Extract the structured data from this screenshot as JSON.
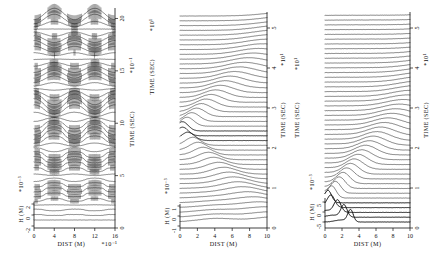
{
  "figure": {
    "title": "",
    "background": "#ffffff",
    "ink": "#111111",
    "panel_count": 3
  },
  "chart_data": [
    {
      "id": "panel-a",
      "type": "line",
      "description": "Stacked wave-height snapshots versus distance at successive times; standing-wave / resonant pattern with dense vertical hatching at the antinodes.",
      "title": "",
      "xlabel": "DIST (M)",
      "x_exponent": "*10⁻¹",
      "ylabel": "H (M)",
      "y_exponent": "*10⁻³",
      "right_axis_label": "TIME (SEC)",
      "right_axis_exponent": "*10⁻¹",
      "xlim": [
        0,
        16
      ],
      "xticks": [
        0,
        4,
        8,
        12,
        16
      ],
      "xticklabels": [
        "0",
        "4",
        "8",
        "12",
        "16"
      ],
      "ylim": [
        -2,
        2
      ],
      "yticks": [
        -2,
        0,
        2
      ],
      "yticklabels": [
        "-2",
        "0",
        "2"
      ],
      "time_lim": [
        0,
        21
      ],
      "time_ticks": [
        0,
        5,
        10,
        15,
        20
      ],
      "time_ticklabels": [
        "0",
        "5",
        "10",
        "15",
        "20"
      ],
      "grid": false,
      "legend": "none",
      "n_traces": 42,
      "trace_style": "solid-black-hairline",
      "hatching": true,
      "pattern": "standing-wave"
    },
    {
      "id": "panel-b",
      "type": "line",
      "description": "Stacked wave-height snapshots versus distance at successive times; single crest focusing at x≈0 then propagating to the right with increasing time.",
      "title": "",
      "xlabel": "DIST (M)",
      "x_exponent": "",
      "ylabel": "H (M)",
      "y_exponent": "*10⁻³",
      "left_axis_label": "TIME (SEC)",
      "left_axis_exponent": "*10¹",
      "right_axis_label": "TIME (SEC)",
      "right_axis_exponent": "*10¹",
      "xlim": [
        0,
        10
      ],
      "xticks": [
        0,
        2,
        4,
        6,
        8,
        10
      ],
      "xticklabels": [
        "0",
        "2",
        "4",
        "6",
        "8",
        "10"
      ],
      "ylim": [
        -1,
        1
      ],
      "yticks": [
        -1,
        0,
        1
      ],
      "yticklabels": [
        "-1",
        "0",
        "1"
      ],
      "time_lim": [
        0,
        5.4
      ],
      "time_ticks": [
        0,
        1,
        2,
        3,
        4,
        5
      ],
      "time_ticklabels": [
        "0",
        "1",
        "2",
        "3",
        "4",
        "5"
      ],
      "grid": false,
      "legend": "none",
      "n_traces": 44,
      "trace_style": "solid-black-hairline",
      "hatching": false,
      "pattern": "focusing-then-diverging"
    },
    {
      "id": "panel-c",
      "type": "line",
      "description": "Stacked wave-height snapshots versus distance at successive times; a V-shaped caustic — a strong pulse travels left, reflects near x≈3 and returns to the right as a sharp ridge.",
      "title": "",
      "xlabel": "DIST (M)",
      "x_exponent": "",
      "ylabel": "H (M)",
      "y_exponent": "*10⁻³",
      "left_axis_label": "TIME (SEC)",
      "left_axis_exponent": "*10¹",
      "right_axis_label": "TIME (SEC)",
      "right_axis_exponent": "*10¹",
      "xlim": [
        0,
        10
      ],
      "xticks": [
        0,
        2,
        4,
        6,
        8,
        10
      ],
      "xticklabels": [
        "0",
        "2",
        "4",
        "6",
        "8",
        "10"
      ],
      "ylim": [
        -5,
        5
      ],
      "yticks": [
        -5,
        0,
        5
      ],
      "yticklabels": [
        "-5",
        "0",
        "5"
      ],
      "time_lim": [
        0,
        5.4
      ],
      "time_ticks": [
        0,
        1,
        2,
        3,
        4,
        5
      ],
      "time_ticklabels": [
        "0",
        "1",
        "2",
        "3",
        "4",
        "5"
      ],
      "grid": false,
      "legend": "none",
      "n_traces": 44,
      "trace_style": "solid-black-hairline",
      "hatching": false,
      "pattern": "v-shaped-caustic"
    }
  ]
}
